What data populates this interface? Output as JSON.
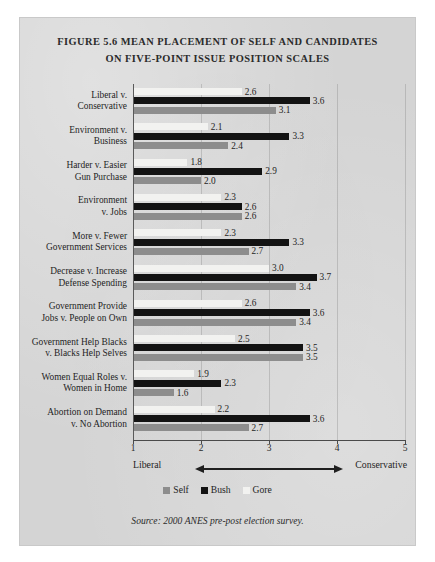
{
  "figure": {
    "title_line1": "FIGURE 5.6 MEAN PLACEMENT OF SELF AND CANDIDATES",
    "title_line2": "ON FIVE-POINT ISSUE POSITION SCALES",
    "source_note": "Source: 2000 ANES pre-post election survey."
  },
  "axis": {
    "left_pole": "Liberal",
    "right_pole": "Conservative",
    "arrow_icon": "double-headed-arrow"
  },
  "legend": {
    "position": "bottom-center",
    "items": [
      {
        "label": "Self",
        "color": "#8d8d8d"
      },
      {
        "label": "Bush",
        "color": "#131313"
      },
      {
        "label": "Gore",
        "color": "#f2f2f0"
      }
    ]
  },
  "chart_data": {
    "type": "bar",
    "orientation": "horizontal",
    "title": "FIGURE 5.6 MEAN PLACEMENT OF SELF AND CANDIDATES ON FIVE-POINT ISSUE POSITION SCALES",
    "xlabel": "Liberal — Conservative",
    "ylabel": "",
    "xlim": [
      1,
      5
    ],
    "xticks": [
      "1",
      "2",
      "3",
      "4",
      "5"
    ],
    "grid": true,
    "legend_position": "bottom-center",
    "bar_order_top_to_bottom": [
      "Gore",
      "Bush",
      "Self"
    ],
    "categories": [
      "Liberal v. Conservative",
      "Environment v. Business",
      "Harder v. Easier Gun Purchase",
      "Environment v. Jobs",
      "More v. Fewer Government Services",
      "Decrease v. Increase Defense Spending",
      "Government Provide Jobs v. People on Own",
      "Government Help Blacks v. Blacks Help Selves",
      "Women Equal Roles v. Women in Home",
      "Abortion on Demand v. No Abortion"
    ],
    "category_lines": [
      [
        "Liberal v.",
        "Conservative"
      ],
      [
        "Environment v.",
        "Business"
      ],
      [
        "Harder v. Easier",
        "Gun Purchase"
      ],
      [
        "Environment",
        "v. Jobs"
      ],
      [
        "More v. Fewer",
        "Government Services"
      ],
      [
        "Decrease v. Increase",
        "Defense Spending"
      ],
      [
        "Government Provide",
        "Jobs v. People on Own"
      ],
      [
        "Government Help Blacks",
        "v. Blacks Help Selves"
      ],
      [
        "Women Equal Roles v.",
        "Women in Home"
      ],
      [
        "Abortion on Demand",
        "v. No Abortion"
      ]
    ],
    "series": [
      {
        "name": "Gore",
        "color": "#f2f2f0",
        "values": [
          2.6,
          2.1,
          1.8,
          2.3,
          2.3,
          3.0,
          2.6,
          2.5,
          1.9,
          2.2
        ]
      },
      {
        "name": "Bush",
        "color": "#131313",
        "values": [
          3.6,
          3.3,
          2.9,
          2.6,
          3.3,
          3.7,
          3.6,
          3.5,
          2.3,
          3.6
        ]
      },
      {
        "name": "Self",
        "color": "#8d8d8d",
        "values": [
          3.1,
          2.4,
          2.0,
          2.6,
          2.7,
          3.4,
          3.4,
          3.5,
          1.6,
          2.7
        ]
      }
    ]
  }
}
